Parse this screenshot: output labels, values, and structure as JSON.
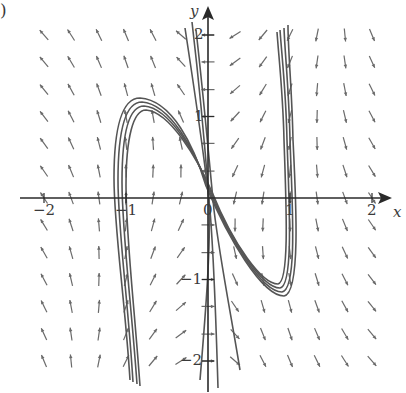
{
  "panel_label": ")",
  "axes": {
    "x_label": "x",
    "y_label": "y",
    "x_ticks": [
      {
        "value": -2,
        "label": "−2"
      },
      {
        "value": -1,
        "label": "−1"
      },
      {
        "value": 0,
        "label": "0"
      },
      {
        "value": 1,
        "label": "1"
      },
      {
        "value": 2,
        "label": "2"
      }
    ],
    "y_ticks": [
      {
        "value": 2,
        "label": "2"
      },
      {
        "value": 1,
        "label": "1"
      },
      {
        "value": -1,
        "label": "−1"
      },
      {
        "value": -2,
        "label": "−2"
      }
    ],
    "xlim": [
      -2.3,
      2.4
    ],
    "ylim": [
      -2.4,
      2.2
    ]
  },
  "colors": {
    "axis": "#2a2a2a",
    "field": "#6a6a6a",
    "trajectory": "#555555",
    "text": "#3a3a3a"
  },
  "field": {
    "description": "direction field of a relaxation-oscillator system; arrows mostly vertical, up on left half, down on right half, bending near cubic nullcline",
    "x_samples": [
      -2.0,
      -1.67,
      -1.33,
      -1.0,
      -0.67,
      -0.33,
      0.0,
      0.33,
      0.67,
      1.0,
      1.33,
      1.67,
      2.0
    ],
    "y_samples": [
      2.0,
      1.67,
      1.33,
      1.0,
      0.67,
      0.33,
      0.0,
      -0.33,
      -0.67,
      -1.0,
      -1.33,
      -1.67,
      -2.0
    ]
  },
  "trajectories_note": "several solution curves converging to a limit cycle following the cubic nullcline y = x^3 - x (approx), with near-vertical fast jumps at x ≈ -0.95 and x ≈ 1.1"
}
